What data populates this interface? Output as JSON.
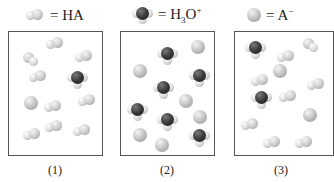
{
  "legend": [
    {
      "icon": "ha-molecule-icon",
      "prefix": "= HA",
      "sub": "",
      "mid": "",
      "sup": ""
    },
    {
      "icon": "hydronium-molecule-icon",
      "prefix": "= H",
      "sub": "3",
      "mid": "O",
      "sup": "+"
    },
    {
      "icon": "anion-molecule-icon",
      "prefix": "= A",
      "sub": "",
      "mid": "",
      "sup": "−"
    }
  ],
  "panels": [
    {
      "label": "(1)",
      "counts": {
        "HA": 9,
        "H3O+": 1,
        "A-": 1
      }
    },
    {
      "label": "(2)",
      "counts": {
        "HA": 0,
        "H3O+": 6,
        "A-": 6
      }
    },
    {
      "label": "(3)",
      "counts": {
        "HA": 9,
        "H3O+": 2,
        "A-": 2
      }
    }
  ],
  "colors": {
    "border": "#555555",
    "anion": "#c8c8c8",
    "hydronium_oxygen": "#3a3a3a",
    "hydrogen": "#dcdcdc"
  }
}
